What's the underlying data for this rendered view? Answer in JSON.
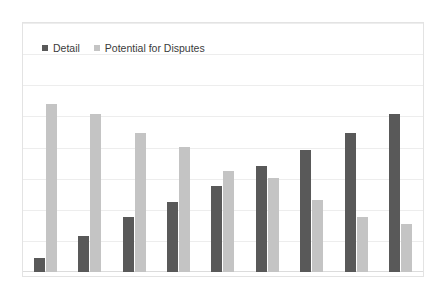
{
  "chart_data": {
    "type": "bar",
    "title": "",
    "xlabel": "",
    "ylabel": "",
    "grid": true,
    "legend_position": "top-left",
    "ylim": [
      0,
      100
    ],
    "categories": [
      "1",
      "2",
      "3",
      "4",
      "5",
      "6",
      "7",
      "8",
      "9"
    ],
    "series": [
      {
        "name": "Detail",
        "color": "#595959",
        "values": [
          6,
          15,
          23,
          29,
          36,
          44,
          51,
          58,
          66
        ]
      },
      {
        "name": "Potential for Disputes",
        "color": "#c4c4c4",
        "values": [
          70,
          66,
          58,
          52,
          42,
          39,
          30,
          23,
          20
        ]
      }
    ]
  },
  "legend": {
    "items": [
      {
        "label": "Detail",
        "color": "#595959"
      },
      {
        "label": "Potential for Disputes",
        "color": "#c4c4c4"
      }
    ]
  },
  "colors": {
    "detail": "#595959",
    "potential": "#c4c4c4",
    "gridline": "#ededed",
    "border": "#e3e3e3",
    "background": "#ffffff"
  }
}
